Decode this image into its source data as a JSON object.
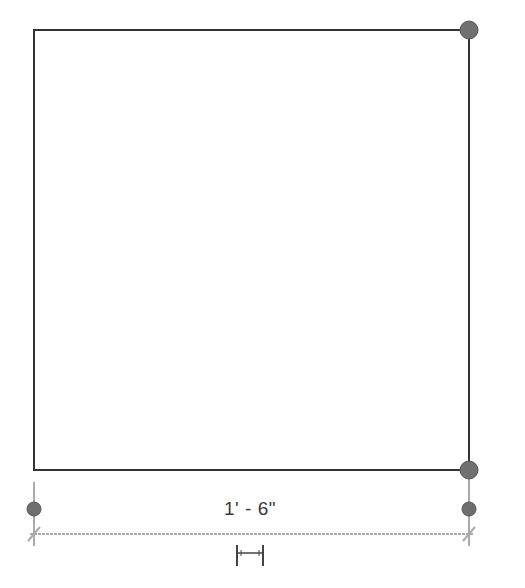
{
  "diagram": {
    "type": "cad-drawing",
    "shape": "rectangle",
    "rectangle": {
      "x1": 34,
      "y1": 30,
      "x2": 469,
      "y2": 470,
      "stroke": "#333333"
    },
    "grips": [
      {
        "name": "top-right-corner-grip",
        "cx": 469,
        "cy": 30
      },
      {
        "name": "bottom-right-corner-grip",
        "cx": 469,
        "cy": 470
      }
    ],
    "dimension": {
      "label": "1' - 6\"",
      "line_y": 534,
      "witness_left_x": 34,
      "witness_right_x": 469,
      "color": "#aaaaaa",
      "grips": [
        {
          "name": "left-witness-grip",
          "cx": 34,
          "cy": 509
        },
        {
          "name": "right-witness-grip",
          "cx": 469,
          "cy": 509
        }
      ],
      "flip_control": "flip-dimension-icon"
    },
    "colors": {
      "grip_fill": "#6e6e6e",
      "grip_stroke": "#555555",
      "line": "#333333",
      "dimension": "#a8a8a8"
    }
  }
}
